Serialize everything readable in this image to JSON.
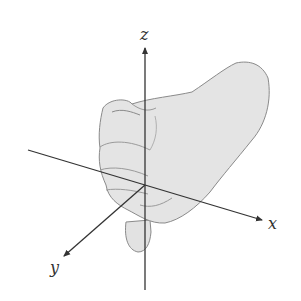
{
  "diagram": {
    "type": "right-hand-rule coordinate axes",
    "axes": {
      "x": {
        "label": "x"
      },
      "y": {
        "label": "y"
      },
      "z": {
        "label": "z"
      }
    },
    "colors": {
      "axis": "#333333",
      "hand_fill": "#e4e4e4",
      "hand_outline": "#8a8a8a",
      "background": "#ffffff"
    }
  }
}
